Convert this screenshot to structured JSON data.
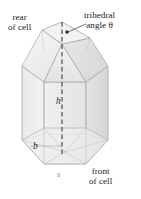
{
  "figure": {
    "labels": {
      "rear_line1": "rear",
      "rear_line2": "of cell",
      "trihedral_line1": "trihedral",
      "trihedral_line2": "angle θ",
      "front_line1": "front",
      "front_line2": "of cell",
      "height": "h",
      "base_edge": "b",
      "side": "s"
    },
    "colors": {
      "background": "#ffffff",
      "text": "#1a1a1a",
      "dim_text": "#2b2b2b",
      "faint_text": "#8a8a8a",
      "edge_line": "#9a9a9a",
      "hidden_edge": "#b5b5b5",
      "axis_dash": "#3a3a3a",
      "face_light": "#f1f1f1",
      "face_mid": "#e6e6e6",
      "face_dark": "#dcdcdc",
      "roof_light": "#f4f4f4",
      "roof_mid": "#e9e9e9",
      "leader": "#3a3a3a"
    }
  }
}
